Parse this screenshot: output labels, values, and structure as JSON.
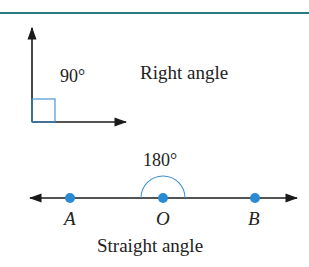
{
  "colors": {
    "rule": "#2b7b7c",
    "line": "#1a1a1a",
    "accent": "#3a8fd1",
    "point": "#2a8ad4"
  },
  "right_angle": {
    "measure": "90°",
    "caption": "Right angle"
  },
  "straight_angle": {
    "measure": "180°",
    "caption": "Straight angle",
    "points": [
      {
        "label": "A",
        "x": 70
      },
      {
        "label": "O",
        "x": 163
      },
      {
        "label": "B",
        "x": 255
      }
    ]
  }
}
